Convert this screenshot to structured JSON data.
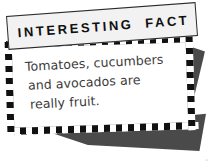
{
  "canvas": {
    "width": 214,
    "height": 164,
    "background_color": "#ffffff"
  },
  "header": {
    "title": "INTERESTING FACT",
    "title_word_1": "INTERESTING",
    "title_word_2": "FACT",
    "background_color": "#f2f2f2",
    "text_color": "#101010",
    "border_color": "#2b2b2b"
  },
  "fact_card": {
    "background_color": "#ffffff",
    "border_color": "#2b2b2b",
    "text_color": "#3a3a3a",
    "lines": [
      "Tomatoes, cucumbers",
      "and avocados are",
      "really fruit."
    ],
    "full_text": "Tomatoes, cucumbers and avocados are really fruit."
  },
  "decoration": {
    "checker_dark": "#111111",
    "checker_light": "#ffffff",
    "shadow_color": "#4a4a4a",
    "corner_mark": "∘"
  }
}
